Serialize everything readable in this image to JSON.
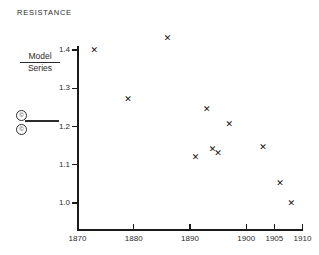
{
  "title": "RESISTANCE",
  "ratio_label": {
    "numerator": "Model",
    "denominator": "Series"
  },
  "legend": {
    "mark_top": "©",
    "mark_bottom": "©"
  },
  "axes": {
    "y_ticklabels": [
      "1.4",
      "1.3",
      "1.2",
      "1.1",
      "1.0"
    ],
    "x_ticklabels": [
      "1870",
      "1880",
      "1890",
      "1900",
      "1905",
      "1910"
    ]
  },
  "chart_data": {
    "type": "scatter",
    "title": "RESISTANCE",
    "xlabel": "",
    "ylabel": "Model / Series",
    "xlim": [
      1870,
      1910
    ],
    "ylim": [
      0.96,
      1.45
    ],
    "grid": false,
    "legend": "none",
    "marker": "x",
    "marker_color": "#111111",
    "x": [
      1873,
      1879,
      1886,
      1891,
      1893,
      1894,
      1895,
      1897,
      1903,
      1906,
      1908
    ],
    "y": [
      1.4,
      1.27,
      1.43,
      1.12,
      1.245,
      1.14,
      1.13,
      1.205,
      1.145,
      1.05,
      1.0
    ],
    "xticks": [
      1870,
      1880,
      1890,
      1900,
      1905,
      1910
    ],
    "yticks": [
      1.0,
      1.1,
      1.2,
      1.3,
      1.4
    ]
  }
}
